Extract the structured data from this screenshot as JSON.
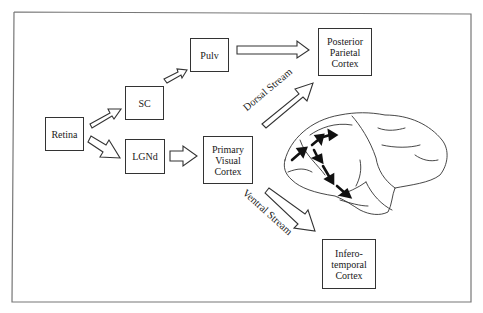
{
  "diagram": {
    "type": "visual-pathways-flow",
    "nodes": {
      "retina": {
        "label": "Retina"
      },
      "sc": {
        "label": "SC"
      },
      "pulv": {
        "label": "Pulv"
      },
      "lgnd": {
        "label": "LGNd"
      },
      "v1": {
        "lines": [
          "Primary",
          "Visual",
          "Cortex"
        ]
      },
      "ppc": {
        "lines": [
          "Posterior",
          "Parietal",
          "Cortex"
        ]
      },
      "it": {
        "lines": [
          "Infero-",
          "temporal",
          "Cortex"
        ]
      }
    },
    "streams": {
      "dorsal": "Dorsal  Stream",
      "ventral": "Ventral  Stream"
    },
    "edges": [
      {
        "from": "retina",
        "to": "sc"
      },
      {
        "from": "retina",
        "to": "lgnd"
      },
      {
        "from": "sc",
        "to": "pulv"
      },
      {
        "from": "pulv",
        "to": "ppc"
      },
      {
        "from": "lgnd",
        "to": "v1"
      },
      {
        "from": "v1",
        "to": "ppc",
        "via": "dorsal"
      },
      {
        "from": "v1",
        "to": "it",
        "via": "ventral"
      }
    ],
    "illustration": "brain-lateral-view-with-pathway-arrows",
    "colors": {
      "line": "#333333",
      "background": "#ffffff"
    }
  }
}
